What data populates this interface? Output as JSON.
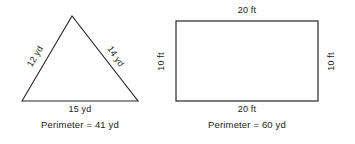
{
  "figures": [
    {
      "id": "triangle",
      "shape": "triangle",
      "units": "yd",
      "sides": [
        {
          "name": "left-side",
          "label": "12 yd",
          "value": 12
        },
        {
          "name": "right-side",
          "label": "14 yd",
          "value": 14
        },
        {
          "name": "base",
          "label": "15 yd",
          "value": 15
        }
      ],
      "perimeter_label": "Perimeter = 41 yd",
      "perimeter_value": 41
    },
    {
      "id": "rectangle",
      "shape": "rectangle",
      "units": "ft",
      "sides": [
        {
          "name": "top-side",
          "label": "20 ft",
          "value": 20
        },
        {
          "name": "bottom-side",
          "label": "20 ft",
          "value": 20
        },
        {
          "name": "left-side",
          "label": "10 ft",
          "value": 10
        },
        {
          "name": "right-side",
          "label": "10 ft",
          "value": 10
        }
      ],
      "perimeter_label": "Perimeter = 60 yd",
      "perimeter_value": 60
    }
  ],
  "style": {
    "stroke_color": "#262626",
    "background_color": "#ffffff",
    "text_color": "#1b1b1b"
  }
}
